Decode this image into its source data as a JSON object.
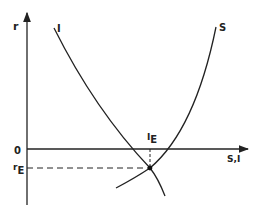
{
  "diagram": {
    "type": "savings-investment equilibrium",
    "axes": {
      "y_label": "r",
      "x_label": "S,I",
      "origin_label": "0"
    },
    "curves": [
      {
        "name": "I",
        "label": "I",
        "shape": "downward-sloping"
      },
      {
        "name": "S",
        "label": "S",
        "shape": "upward-sloping"
      }
    ],
    "equilibrium": {
      "r_label": "r",
      "r_subscript": "E",
      "i_label": "I",
      "i_subscript": "E"
    },
    "colors": {
      "line": "#222222",
      "background": "#ffffff"
    }
  }
}
